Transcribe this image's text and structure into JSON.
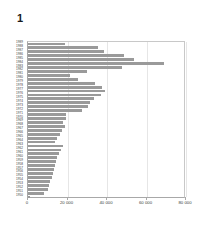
{
  "chart_data": {
    "type": "bar",
    "orientation": "horizontal",
    "title": "1",
    "xlabel": "",
    "ylabel": "",
    "xlim": [
      0,
      80000
    ],
    "ylim": null,
    "grid": true,
    "legend": null,
    "bar_color": "#9a9a9a",
    "xticks": [
      0,
      20000,
      40000,
      60000,
      80000
    ],
    "xticklabels": [
      "0",
      "20 000",
      "40 000",
      "60 000",
      "80 000"
    ],
    "categories": [
      "1989",
      "1988",
      "1987",
      "1986",
      "1985",
      "1984",
      "1983",
      "1982",
      "1981",
      "1980",
      "1979",
      "1978",
      "1977",
      "1976",
      "1975",
      "1974",
      "1973",
      "1972",
      "1971",
      "1970",
      "1969",
      "1968",
      "1967",
      "1966",
      "1965",
      "1964",
      "1963",
      "1962",
      "1961",
      "1960",
      "1959",
      "1958",
      "1957",
      "1956",
      "1955",
      "1954",
      "1953",
      "1952",
      "1951",
      "1950"
    ],
    "values": [
      18500,
      35500,
      38500,
      48500,
      53500,
      69000,
      47500,
      30000,
      21500,
      25500,
      34000,
      37500,
      39000,
      37000,
      33500,
      31500,
      30500,
      27500,
      19000,
      19000,
      17500,
      18500,
      17000,
      16000,
      14500,
      13500,
      17500,
      16500,
      15500,
      14500,
      14000,
      13500,
      13000,
      12500,
      12000,
      11000,
      10500,
      10000,
      8000,
      1200
    ]
  },
  "title": {
    "text": "1"
  }
}
